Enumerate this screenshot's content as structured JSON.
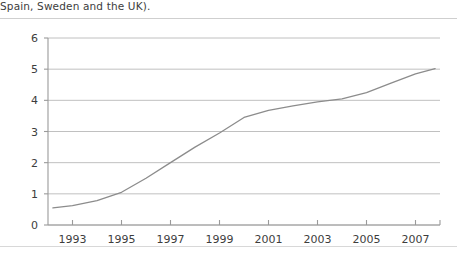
{
  "caption": {
    "text": "Spain, Sweden and the UK)."
  },
  "colors": {
    "gridline": "#b9b9b9",
    "axis": "#9a9a9a",
    "series_line": "#8c8c8c",
    "text": "#3d3d3d",
    "rule": "#cfcfcf"
  },
  "chart_data": {
    "type": "line",
    "title": "",
    "subtitle": "",
    "xlabel": "",
    "ylabel": "",
    "xlim": [
      1992,
      2008
    ],
    "ylim": [
      0,
      6
    ],
    "grid": true,
    "legend": "none",
    "y_ticks": [
      0,
      1,
      2,
      3,
      4,
      5,
      6
    ],
    "y_tick_labels": [
      "0",
      "1",
      "2",
      "3",
      "4",
      "5",
      "6"
    ],
    "x_ticks": [
      1993,
      1995,
      1997,
      1999,
      2001,
      2003,
      2005,
      2007
    ],
    "x_tick_labels": [
      "1993",
      "1995",
      "1997",
      "1999",
      "2001",
      "2003",
      "2005",
      "2007"
    ],
    "series": [
      {
        "name": "",
        "x": [
          1992.2,
          1993,
          1994,
          1995,
          1996,
          1997,
          1998,
          1999,
          2000,
          2001,
          2002,
          2003,
          2004,
          2005,
          2006,
          2007,
          2007.8
        ],
        "values": [
          0.55,
          0.62,
          0.78,
          1.05,
          1.5,
          2.0,
          2.5,
          2.95,
          3.45,
          3.68,
          3.82,
          3.95,
          4.05,
          4.25,
          4.55,
          4.85,
          5.02
        ]
      }
    ]
  }
}
